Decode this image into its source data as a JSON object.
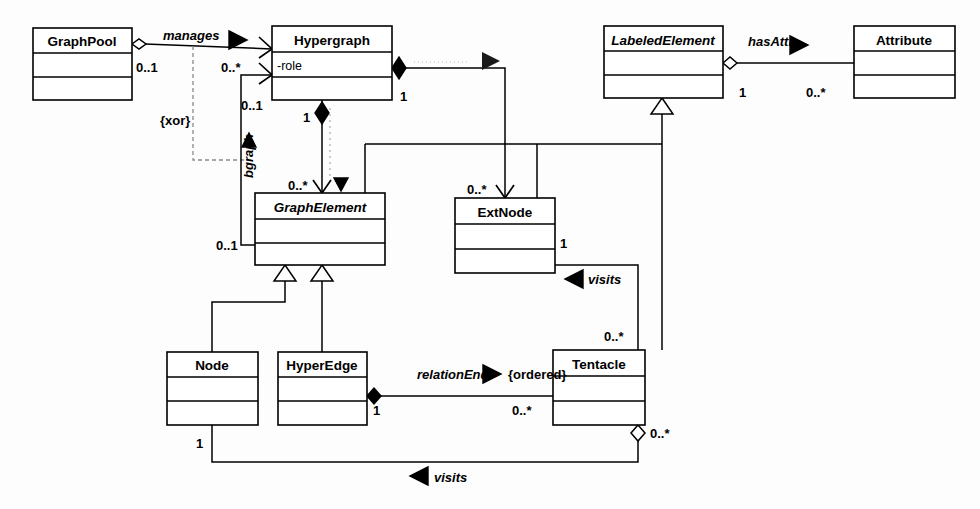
{
  "diagram": {
    "type": "uml-class-diagram",
    "colors": {
      "stroke": "#000000",
      "fill": "#ffffff",
      "background": "#fdfdfd",
      "faded_text": "#d8d8d8",
      "dashed_constraint": "#8a8a8a"
    }
  },
  "classes": [
    {
      "id": "graphpool",
      "name": "GraphPool",
      "abstract": false,
      "attributes": [],
      "x": 33,
      "y": 28,
      "w": 99,
      "h": 72
    },
    {
      "id": "hypergraph",
      "name": "Hypergraph",
      "abstract": false,
      "attributes": [
        "-role"
      ],
      "x": 272,
      "y": 26,
      "w": 120,
      "h": 74
    },
    {
      "id": "labeledelement",
      "name": "LabeledElement",
      "abstract": true,
      "attributes": [],
      "x": 604,
      "y": 26,
      "w": 119,
      "h": 72
    },
    {
      "id": "attribute",
      "name": "Attribute",
      "abstract": false,
      "attributes": [],
      "x": 854,
      "y": 26,
      "w": 101,
      "h": 72
    },
    {
      "id": "graphelement",
      "name": "GraphElement",
      "abstract": true,
      "attributes": [],
      "x": 255,
      "y": 193,
      "w": 130,
      "h": 72
    },
    {
      "id": "extnode",
      "name": "ExtNode",
      "abstract": false,
      "attributes": [],
      "x": 455,
      "y": 198,
      "w": 100,
      "h": 75
    },
    {
      "id": "node",
      "name": "Node",
      "abstract": false,
      "attributes": [],
      "x": 167,
      "y": 352,
      "w": 91,
      "h": 73
    },
    {
      "id": "hyperedge",
      "name": "HyperEdge",
      "abstract": false,
      "attributes": [],
      "x": 278,
      "y": 352,
      "w": 89,
      "h": 73
    },
    {
      "id": "tentacle",
      "name": "Tentacle",
      "abstract": false,
      "attributes": [],
      "x": 553,
      "y": 350,
      "w": 92,
      "h": 75
    }
  ],
  "associations": [
    {
      "id": "manages",
      "label": "manages",
      "label_x": 163,
      "label_y": 38,
      "arrow": "right",
      "from": "graphpool",
      "to": "hypergraph",
      "source_mult": "0..1",
      "source_mult_x": 139,
      "source_mult_y": 70,
      "target_mult": "0..*",
      "target_mult_x": 222,
      "target_mult_y": 70,
      "end_source": "aggregation-hollow-diamond",
      "end_target": "open-arrow"
    },
    {
      "id": "bgraph",
      "label": "bgraph",
      "label_x": 248,
      "label_y": 175,
      "arrow": "up",
      "from": "graphelement",
      "to": "hypergraph",
      "source_mult": "0..1",
      "source_mult_x": 218,
      "source_mult_y": 247,
      "target_mult": "0..1",
      "target_mult_x": 243,
      "target_mult_y": 105,
      "end_target": "open-arrow"
    },
    {
      "id": "xor-constraint",
      "label": "{xor}",
      "label_x": 166,
      "label_y": 121
    },
    {
      "id": "hypergraph-graphelement",
      "label": "",
      "from": "hypergraph",
      "to": "graphelement",
      "source_mult": "1",
      "source_mult_x": 305,
      "source_mult_y": 117,
      "target_mult": "0..*",
      "target_mult_x": 291,
      "target_mult_y": 184,
      "end_source": "composition-filled-diamond",
      "end_target": "filled-triangle-down"
    },
    {
      "id": "hypergraph-extnode",
      "label": "",
      "from": "hypergraph",
      "to": "extnode",
      "source_mult": "1",
      "source_mult_x": 398,
      "source_mult_y": 97,
      "target_mult": "0..*",
      "target_mult_x": 470,
      "target_mult_y": 189,
      "end_source": "composition-filled-diamond",
      "end_target": "open-arrow-down"
    },
    {
      "id": "hasattr",
      "label": "hasAttr",
      "label_x": 750,
      "label_y": 44,
      "arrow": "right",
      "from": "labeledelement",
      "to": "attribute",
      "source_mult": "1",
      "source_mult_x": 742,
      "source_mult_y": 93,
      "target_mult": "0..*",
      "target_mult_x": 810,
      "target_mult_y": 93,
      "end_source": "aggregation-hollow-diamond"
    },
    {
      "id": "relationend",
      "label": "relationEnd",
      "label_x": 420,
      "label_y": 372,
      "arrow": "right",
      "from": "hyperedge",
      "to": "tentacle",
      "source_mult": "1",
      "source_mult_x": 376,
      "source_mult_y": 410,
      "target_mult": "0..*",
      "target_mult_x": 513,
      "target_mult_y": 410,
      "ordered_label": "{ordered}",
      "ordered_x": 490,
      "ordered_y": 377,
      "end_source": "composition-filled-diamond"
    },
    {
      "id": "extnode-visits-tentacle",
      "label": "visits",
      "label_x": 588,
      "label_y": 277,
      "arrow": "left",
      "from": "tentacle",
      "to": "extnode",
      "source_mult": "1",
      "source_mult_x": 562,
      "source_mult_y": 243,
      "target_mult": "0..*",
      "target_mult_x": 607,
      "target_mult_y": 337
    },
    {
      "id": "node-visits-tentacle",
      "label": "visits",
      "label_x": 440,
      "label_y": 475,
      "arrow": "left",
      "from": "tentacle",
      "to": "node",
      "source_mult": "1",
      "source_mult_x": 211,
      "source_mult_y": 444,
      "target_mult": "0..*",
      "target_mult_x": 666,
      "target_mult_y": 440,
      "end_source": "aggregation-hollow-diamond"
    }
  ],
  "generalizations": [
    {
      "id": "node-to-graphelement",
      "from": "node",
      "to": "graphelement"
    },
    {
      "id": "hyperedge-to-graphelement",
      "from": "hyperedge",
      "to": "graphelement"
    },
    {
      "id": "tentacle-to-labeledelement",
      "from": "tentacle",
      "to": "labeledelement"
    },
    {
      "id": "extnode-to-labeledelement",
      "from": "extnode",
      "to": "labeledelement"
    }
  ],
  "faded_label": {
    "text": "",
    "x": 418,
    "y": 62
  }
}
